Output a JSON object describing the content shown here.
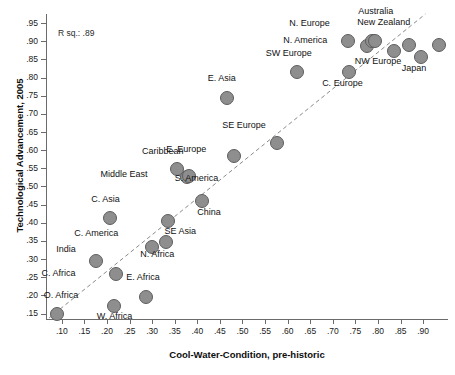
{
  "chart_data": {
    "type": "scatter",
    "title": "",
    "xlabel": "Cool-Water-Condition, pre-historic",
    "ylabel": "Technological Advancement, 2005",
    "xlim": [
      0.065,
      0.955
    ],
    "ylim": [
      0.135,
      0.975
    ],
    "xticks": [
      ".10",
      ".15",
      ".20",
      ".25",
      ".30",
      ".35",
      ".40",
      ".45",
      ".50",
      ".55",
      ".60",
      ".65",
      ".70",
      ".75",
      ".80",
      ".85",
      ".90"
    ],
    "xtick_values": [
      0.1,
      0.15,
      0.2,
      0.25,
      0.3,
      0.35,
      0.4,
      0.45,
      0.5,
      0.55,
      0.6,
      0.65,
      0.7,
      0.75,
      0.8,
      0.85,
      0.9
    ],
    "yticks": [
      ".15",
      ".20",
      ".25",
      ".30",
      ".35",
      ".40",
      ".45",
      ".50",
      ".55",
      ".60",
      ".65",
      ".70",
      ".75",
      ".80",
      ".85",
      ".90",
      ".95"
    ],
    "ytick_values": [
      0.15,
      0.2,
      0.25,
      0.3,
      0.35,
      0.4,
      0.45,
      0.5,
      0.55,
      0.6,
      0.65,
      0.7,
      0.75,
      0.8,
      0.85,
      0.9,
      0.95
    ],
    "grid": false,
    "legend": "none",
    "annotation": "R sq.: .89",
    "r_squared": 0.89,
    "marker_color": "#8e8e8e",
    "marker_edge_color": "#5d5d5d",
    "trendline": {
      "style": "dashed",
      "color": "#8a8a8a",
      "x0": 0.072,
      "y0": 0.138,
      "x1": 0.905,
      "y1": 0.975
    },
    "points": [
      {
        "label": "O. Africa",
        "x": 0.09,
        "y": 0.15,
        "label_dx": 4,
        "label_dy": -19
      },
      {
        "label": "W. Africa",
        "x": 0.215,
        "y": 0.17,
        "label_dx": 1,
        "label_dy": 10
      },
      {
        "label": "E. Africa",
        "x": 0.287,
        "y": 0.196,
        "label_dx": -3,
        "label_dy": -20
      },
      {
        "label": "C. Africa",
        "x": 0.221,
        "y": 0.259,
        "label_dx": -58,
        "label_dy": -1
      },
      {
        "label": "India",
        "x": 0.176,
        "y": 0.296,
        "label_dx": -30,
        "label_dy": -12
      },
      {
        "label": "C. America",
        "x": 0.3,
        "y": 0.332,
        "label_dx": -56,
        "label_dy": -14
      },
      {
        "label": "N. Africa",
        "x": 0.331,
        "y": 0.346,
        "label_dx": -9,
        "label_dy": 12
      },
      {
        "label": "SE Asia",
        "x": 0.336,
        "y": 0.404,
        "label_dx": 12,
        "label_dy": 10
      },
      {
        "label": "C. Asia",
        "x": 0.206,
        "y": 0.414,
        "label_dx": -4,
        "label_dy": -19
      },
      {
        "label": "China",
        "x": 0.411,
        "y": 0.461,
        "label_dx": 7,
        "label_dy": 11
      },
      {
        "label": "Middle East",
        "x": 0.377,
        "y": 0.525,
        "label_dx": -63,
        "label_dy": -3
      },
      {
        "label": "S. America",
        "x": 0.381,
        "y": 0.528,
        "label_dx": 8,
        "label_dy": 2
      },
      {
        "label": "Caribbean",
        "x": 0.355,
        "y": 0.549,
        "label_dx": -14,
        "label_dy": -18
      },
      {
        "label": "E. Europe",
        "x": 0.482,
        "y": 0.585,
        "label_dx": -48,
        "label_dy": -7
      },
      {
        "label": "SE Europe",
        "x": 0.577,
        "y": 0.621,
        "label_dx": -33,
        "label_dy": -18
      },
      {
        "label": "E. Asia",
        "x": 0.465,
        "y": 0.745,
        "label_dx": -5,
        "label_dy": -20
      },
      {
        "label": "SW Europe",
        "x": 0.62,
        "y": 0.816,
        "label_dx": -8,
        "label_dy": -19
      },
      {
        "label": "C. Europe",
        "x": 0.735,
        "y": 0.814,
        "label_dx": -6,
        "label_dy": 11
      },
      {
        "label": "N. America",
        "x": 0.776,
        "y": 0.886,
        "label_dx": -62,
        "label_dy": -6
      },
      {
        "label": "N. Europe",
        "x": 0.733,
        "y": 0.901,
        "label_dx": -38,
        "label_dy": -18
      },
      {
        "label": "Australia",
        "x": 0.786,
        "y": 0.902,
        "label_dx": 4,
        "label_dy": -30
      },
      {
        "label": "New Zealand",
        "x": 0.793,
        "y": 0.901,
        "label_dx": 9,
        "label_dy": -19
      },
      {
        "label": "NW Europe",
        "x": 0.836,
        "y": 0.874,
        "label_dx": -16,
        "label_dy": 10
      },
      {
        "label": "Japan",
        "x": 0.896,
        "y": 0.856,
        "label_dx": -7,
        "label_dy": 11
      },
      {
        "label": "",
        "x": 0.868,
        "y": 0.889,
        "label_dx": 0,
        "label_dy": 0
      },
      {
        "label": "",
        "x": 0.936,
        "y": 0.89,
        "label_dx": 0,
        "label_dy": 0
      }
    ]
  }
}
